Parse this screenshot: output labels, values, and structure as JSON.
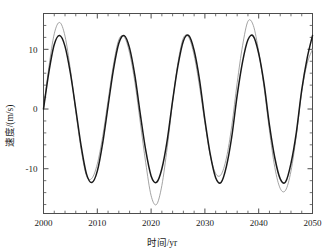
{
  "chart_data": {
    "type": "line",
    "title": "",
    "xlabel": "时间/yr",
    "ylabel": "速度/(m/s)",
    "xlim": [
      2000,
      2050
    ],
    "ylim": [
      -17.5,
      16.0
    ],
    "xticks": [
      2000,
      2010,
      2020,
      2030,
      2040,
      2050
    ],
    "xtick_labels": [
      "2000",
      "2010",
      "2020",
      "2030",
      "2040",
      "2050"
    ],
    "yticks": [
      -10,
      0,
      10
    ],
    "ytick_labels": [
      "-10",
      "0",
      "10"
    ],
    "x_minor_interval": 2,
    "y_minor_interval": 2,
    "grid": false,
    "legend": "none",
    "series": [
      {
        "name": "thick-black-curve",
        "color": "#1a1a1a",
        "line_width": 1.5,
        "description": "Regular sinusoid, constant amplitude 12.3 m/s, period 11.5 yr, starts at 0 in 2000",
        "x": [
          2000,
          2001,
          2002,
          2003,
          2004,
          2005,
          2006,
          2007,
          2008,
          2009,
          2010,
          2011,
          2012,
          2013,
          2014,
          2015,
          2016,
          2017,
          2018,
          2019,
          2020,
          2021,
          2022,
          2023,
          2024,
          2025,
          2026,
          2027,
          2028,
          2029,
          2030,
          2031,
          2032,
          2033,
          2034,
          2035,
          2036,
          2037,
          2038,
          2039,
          2040,
          2041,
          2042,
          2043,
          2044,
          2045,
          2046,
          2047,
          2048,
          2049,
          2050
        ],
        "y": [
          0.0,
          6.2,
          10.8,
          12.3,
          10.5,
          6.0,
          0.0,
          -6.2,
          -10.9,
          -12.3,
          -10.4,
          -5.7,
          0.5,
          6.6,
          11.0,
          12.3,
          10.2,
          5.5,
          -0.9,
          -6.9,
          -11.2,
          -12.3,
          -10.0,
          -5.2,
          1.4,
          7.3,
          11.4,
          12.3,
          9.8,
          4.9,
          -1.8,
          -7.6,
          -11.5,
          -12.3,
          -9.6,
          -4.6,
          2.3,
          7.9,
          11.6,
          12.2,
          9.3,
          4.2,
          -2.7,
          -8.2,
          -11.7,
          -12.2,
          -9.1,
          -3.9,
          3.2,
          8.5,
          12.3
        ]
      },
      {
        "name": "thin-gray-curve",
        "color": "#8c8c8c",
        "line_width": 0.8,
        "description": "Modulated oscillation, amplitude varies 10.5 to 16, peaks 14.5 near 2003 and 14.7 near 2038, deep trough -16 near 2021",
        "x": [
          2000,
          2001,
          2002,
          2003,
          2004,
          2005,
          2006,
          2007,
          2008,
          2009,
          2010,
          2011,
          2012,
          2013,
          2014,
          2015,
          2016,
          2017,
          2018,
          2019,
          2020,
          2021,
          2022,
          2023,
          2024,
          2025,
          2026,
          2027,
          2028,
          2029,
          2030,
          2031,
          2032,
          2033,
          2034,
          2035,
          2036,
          2037,
          2038,
          2039,
          2040,
          2041,
          2042,
          2043,
          2044,
          2045,
          2046,
          2047,
          2048,
          2049,
          2050
        ],
        "y": [
          0.0,
          7.0,
          12.6,
          14.5,
          12.2,
          6.6,
          -0.4,
          -6.8,
          -11.2,
          -11.6,
          -9.2,
          -4.6,
          1.4,
          7.4,
          11.6,
          12.1,
          9.4,
          4.4,
          -2.3,
          -9.0,
          -14.5,
          -16.0,
          -12.8,
          -6.4,
          1.2,
          7.8,
          11.9,
          12.0,
          9.0,
          3.8,
          -2.3,
          -7.8,
          -10.8,
          -11.0,
          -8.2,
          -2.8,
          4.4,
          10.6,
          14.7,
          14.0,
          9.6,
          3.6,
          -3.6,
          -9.8,
          -13.3,
          -13.6,
          -10.4,
          -4.4,
          2.9,
          7.6,
          10.0
        ]
      }
    ]
  },
  "axes": {
    "frame_color": "#4d4d4d",
    "background": "#ffffff"
  }
}
